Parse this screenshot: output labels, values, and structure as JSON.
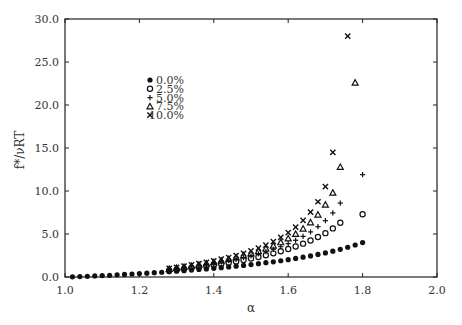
{
  "chart_data": {
    "type": "scatter",
    "title": "",
    "xlabel": "α",
    "ylabel": "f*/νRT",
    "xlim": [
      1.0,
      2.0
    ],
    "ylim": [
      0.0,
      30.0
    ],
    "xticks": [
      "1.0",
      "1.2",
      "1.4",
      "1.6",
      "1.8",
      "2.0"
    ],
    "yticks": [
      "0.0",
      "5.0",
      "10.0",
      "15.0",
      "20.0",
      "25.0",
      "30.0"
    ],
    "grid": false,
    "legend_position": "upper-left",
    "x": [
      1.02,
      1.04,
      1.06,
      1.08,
      1.1,
      1.12,
      1.14,
      1.16,
      1.18,
      1.2,
      1.22,
      1.24,
      1.26,
      1.28,
      1.3,
      1.32,
      1.34,
      1.36,
      1.38,
      1.4,
      1.42,
      1.44,
      1.46,
      1.48,
      1.5,
      1.52,
      1.54,
      1.56,
      1.58,
      1.6,
      1.62,
      1.64,
      1.66,
      1.68,
      1.7,
      1.72,
      1.74,
      1.76,
      1.78,
      1.8
    ],
    "series": [
      {
        "name": "0.0%",
        "marker": "filled-circle",
        "values": [
          0.02,
          0.05,
          0.08,
          0.12,
          0.16,
          0.2,
          0.25,
          0.3,
          0.35,
          0.4,
          0.45,
          0.5,
          0.55,
          0.61,
          0.67,
          0.73,
          0.8,
          0.87,
          0.94,
          1.01,
          1.09,
          1.17,
          1.26,
          1.35,
          1.45,
          1.55,
          1.66,
          1.77,
          1.89,
          2.02,
          2.16,
          2.3,
          2.45,
          2.62,
          2.8,
          3.0,
          3.22,
          3.46,
          3.72,
          4.0
        ]
      },
      {
        "name": "2.5%",
        "marker": "open-circle",
        "values": [
          null,
          null,
          null,
          null,
          null,
          null,
          null,
          null,
          null,
          null,
          null,
          null,
          null,
          0.75,
          0.85,
          0.95,
          1.05,
          1.15,
          1.27,
          1.39,
          1.52,
          1.66,
          1.81,
          1.97,
          2.14,
          2.33,
          2.53,
          2.75,
          2.99,
          3.25,
          3.55,
          3.88,
          4.25,
          4.65,
          5.1,
          5.65,
          6.3,
          null,
          null,
          7.3
        ]
      },
      {
        "name": "5.0%",
        "marker": "plus",
        "values": [
          null,
          null,
          null,
          null,
          null,
          null,
          null,
          null,
          null,
          null,
          null,
          null,
          null,
          0.85,
          0.96,
          1.07,
          1.19,
          1.31,
          1.44,
          1.58,
          1.73,
          1.89,
          2.06,
          2.25,
          2.46,
          2.69,
          2.94,
          3.22,
          3.53,
          3.88,
          4.27,
          4.72,
          5.24,
          5.85,
          6.55,
          7.45,
          8.6,
          null,
          null,
          11.9
        ]
      },
      {
        "name": "7.5%",
        "marker": "open-triangle",
        "values": [
          null,
          null,
          null,
          null,
          null,
          null,
          null,
          null,
          null,
          null,
          null,
          null,
          null,
          0.92,
          1.04,
          1.16,
          1.29,
          1.42,
          1.57,
          1.72,
          1.89,
          2.07,
          2.27,
          2.49,
          2.73,
          3.0,
          3.3,
          3.64,
          4.03,
          4.48,
          5.0,
          5.62,
          6.35,
          7.25,
          8.4,
          9.8,
          12.8,
          null,
          22.6,
          null
        ]
      },
      {
        "name": "10.0%",
        "marker": "x",
        "values": [
          null,
          null,
          null,
          null,
          null,
          null,
          null,
          null,
          null,
          null,
          null,
          null,
          null,
          1.0,
          1.13,
          1.26,
          1.4,
          1.55,
          1.71,
          1.88,
          2.07,
          2.27,
          2.5,
          2.75,
          3.03,
          3.35,
          3.71,
          4.12,
          4.6,
          5.15,
          5.8,
          6.58,
          7.55,
          8.75,
          10.5,
          14.5,
          null,
          28.0,
          null,
          null
        ]
      }
    ]
  }
}
